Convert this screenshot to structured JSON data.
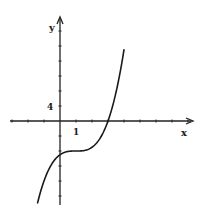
{
  "chart_data": {
    "type": "line",
    "title": "",
    "xlabel": "x",
    "ylabel": "y",
    "tick_labels": {
      "x": "1",
      "y": "4"
    },
    "x_tick_unit": 1,
    "y_tick_unit": 4,
    "xlim": [
      -3.7,
      8.3
    ],
    "ylim": [
      -22,
      27
    ],
    "grid": false,
    "legend": null,
    "series": [
      {
        "name": "f(x)",
        "description": "cubic curve with inflection near (1, -8), y-intercept near -9, x-intercept near 3",
        "x": [
          -1.4,
          -1.0,
          -0.5,
          0,
          0.5,
          1.0,
          1.5,
          2.0,
          2.5,
          3.0,
          3.5,
          4.0
        ],
        "values": [
          -21.8,
          -16.0,
          -11.4,
          -9.0,
          -8.1,
          -8.0,
          -7.9,
          -7.0,
          -4.6,
          0.0,
          7.6,
          19.0
        ]
      }
    ]
  },
  "axes": {
    "x_label": "x",
    "y_label": "y",
    "x_tick_label": "1",
    "y_tick_label": "4"
  }
}
